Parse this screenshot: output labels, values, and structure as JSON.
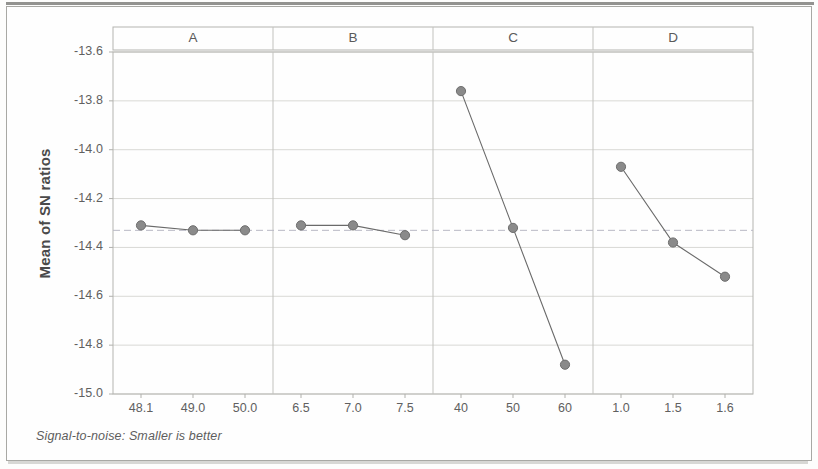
{
  "chart_data": {
    "type": "line",
    "title": "",
    "xlabel": "",
    "ylabel": "Mean of SN ratios",
    "ylim": [
      -15.0,
      -13.6
    ],
    "ytick_labels": [
      "-13.6",
      "-13.8",
      "-14.0",
      "-14.2",
      "-14.4",
      "-14.6",
      "-14.8",
      "-15.0"
    ],
    "ytick_values": [
      -13.6,
      -13.8,
      -14.0,
      -14.2,
      -14.4,
      -14.6,
      -14.8,
      -15.0
    ],
    "grid": true,
    "legend": "none",
    "reference_line_value": -14.33,
    "footnote": "Signal-to-noise: Smaller is better",
    "panels": [
      {
        "name": "A",
        "categories": [
          "48.1",
          "49.0",
          "50.0"
        ],
        "values": [
          -14.31,
          -14.33,
          -14.33
        ]
      },
      {
        "name": "B",
        "categories": [
          "6.5",
          "7.0",
          "7.5"
        ],
        "values": [
          -14.31,
          -14.31,
          -14.35
        ]
      },
      {
        "name": "C",
        "categories": [
          "40",
          "50",
          "60"
        ],
        "values": [
          -13.76,
          -14.32,
          -14.88
        ]
      },
      {
        "name": "D",
        "categories": [
          "1.0",
          "1.5",
          "1.6"
        ],
        "values": [
          -14.07,
          -14.38,
          -14.52
        ]
      }
    ],
    "colors": {
      "marker": "#8a8a8a",
      "line": "#6a6a6a",
      "grid": "#d9d9d5",
      "reference_line": "#b9b9c4",
      "frame": "#b4b4b0",
      "text": "#606060"
    }
  }
}
